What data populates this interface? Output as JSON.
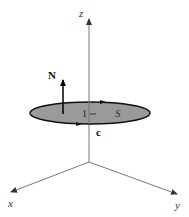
{
  "diagram": {
    "type": "3d-vector-surface",
    "axes": {
      "z_label": "z",
      "x_label": "x",
      "y_label": "y"
    },
    "surface": {
      "label": "S",
      "fill": "#9a9a9a",
      "stroke": "#111111"
    },
    "normal_vector": {
      "label": "N"
    },
    "curve": {
      "label": "c"
    },
    "unit_mark": "1",
    "colors": {
      "axis": "#777777",
      "arrow": "#111111"
    }
  }
}
